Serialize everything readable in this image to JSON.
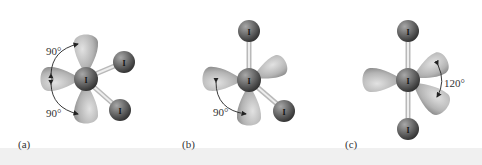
{
  "figure": {
    "panels": [
      {
        "id": "a",
        "label": "(a)",
        "central_atom": "I",
        "terminal_atoms": [
          "I",
          "I"
        ],
        "angles": [
          {
            "value": "90°",
            "position": "upper-left"
          },
          {
            "value": "90°",
            "position": "lower-left"
          }
        ]
      },
      {
        "id": "b",
        "label": "(b)",
        "central_atom": "I",
        "terminal_atoms": [
          "I",
          "I"
        ],
        "angles": [
          {
            "value": "90°",
            "position": "lower-left"
          }
        ]
      },
      {
        "id": "c",
        "label": "(c)",
        "central_atom": "I",
        "terminal_atoms": [
          "I",
          "I"
        ],
        "angles": [
          {
            "value": "120°",
            "position": "right"
          }
        ]
      }
    ]
  },
  "colors": {
    "lobe_light": "#d6d6d6",
    "lobe_dark": "#8a8a8a",
    "atom_light": "#9a9a9a",
    "atom_dark": "#3c3c3c",
    "bond": "#cfcfcf",
    "text": "#333333"
  }
}
